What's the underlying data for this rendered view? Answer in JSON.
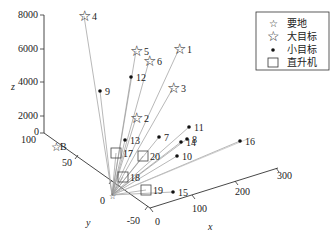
{
  "chart_data": {
    "type": "scatter",
    "subtype": "3d-scatter-with-lines-from-origin",
    "title": "",
    "xlabel": "x",
    "ylabel": "y",
    "zlabel": "z",
    "axes": {
      "x": {
        "ticks": [
          "0",
          "100",
          "200",
          "300"
        ],
        "range": [
          0,
          300
        ]
      },
      "y": {
        "ticks": [
          "100",
          "50",
          "0",
          "-50"
        ],
        "range": [
          -50,
          100
        ]
      },
      "z": {
        "ticks": [
          "0",
          "2000",
          "4000",
          "6000",
          "8000"
        ],
        "range": [
          0,
          8000
        ]
      }
    },
    "origin_label": "B",
    "legend": [
      {
        "marker": "small-star",
        "label": "要地"
      },
      {
        "marker": "large-star",
        "label": "大目标"
      },
      {
        "marker": "dot",
        "label": "小目标"
      },
      {
        "marker": "square",
        "label": "直升机"
      }
    ],
    "points": [
      {
        "id": "1",
        "type": "large-star",
        "px": 179,
        "py": 49
      },
      {
        "id": "2",
        "type": "large-star",
        "px": 136,
        "py": 118
      },
      {
        "id": "3",
        "type": "large-star",
        "px": 173,
        "py": 88
      },
      {
        "id": "4",
        "type": "large-star",
        "px": 84,
        "py": 16
      },
      {
        "id": "5",
        "type": "large-star",
        "px": 136,
        "py": 51
      },
      {
        "id": "6",
        "type": "large-star",
        "px": 149,
        "py": 61
      },
      {
        "id": "7",
        "type": "dot",
        "px": 159,
        "py": 137
      },
      {
        "id": "8",
        "type": "dot",
        "px": 187,
        "py": 139
      },
      {
        "id": "9",
        "type": "dot",
        "px": 100,
        "py": 91
      },
      {
        "id": "10",
        "type": "dot",
        "px": 177,
        "py": 156
      },
      {
        "id": "11",
        "type": "dot",
        "px": 189,
        "py": 127
      },
      {
        "id": "12",
        "type": "dot",
        "px": 131,
        "py": 77
      },
      {
        "id": "13",
        "type": "dot",
        "px": 125,
        "py": 140
      },
      {
        "id": "14",
        "type": "dot",
        "px": 181,
        "py": 142
      },
      {
        "id": "15",
        "type": "dot",
        "px": 173,
        "py": 192
      },
      {
        "id": "16",
        "type": "dot",
        "px": 240,
        "py": 141
      },
      {
        "id": "17",
        "type": "square",
        "px": 116,
        "py": 153
      },
      {
        "id": "18",
        "type": "square",
        "px": 123,
        "py": 177
      },
      {
        "id": "19",
        "type": "square",
        "px": 146,
        "py": 190
      },
      {
        "id": "20",
        "type": "square",
        "px": 143,
        "py": 156
      }
    ],
    "legend_position": "upper-right",
    "grid": false
  }
}
